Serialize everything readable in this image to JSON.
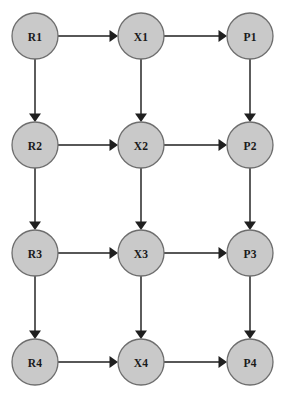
{
  "diagram": {
    "type": "directed-graph",
    "layout": "grid",
    "columns": 3,
    "rows": 4,
    "background_color": "#ffffff",
    "node_fill_color": "#c9c9c9",
    "node_stroke_color": "#6e6e6e",
    "edge_color": "#1f1f1f",
    "label_color": "#1a1a1a",
    "node_radius": 23,
    "nodes": [
      {
        "id": "R1",
        "label": "R1",
        "column": 0,
        "row": 0,
        "cx": 35,
        "cy": 36
      },
      {
        "id": "X1",
        "label": "X1",
        "column": 1,
        "row": 0,
        "cx": 141,
        "cy": 36
      },
      {
        "id": "P1",
        "label": "P1",
        "column": 2,
        "row": 0,
        "cx": 250,
        "cy": 36
      },
      {
        "id": "R2",
        "label": "R2",
        "column": 0,
        "row": 1,
        "cx": 35,
        "cy": 145
      },
      {
        "id": "X2",
        "label": "X2",
        "column": 1,
        "row": 1,
        "cx": 141,
        "cy": 145
      },
      {
        "id": "P2",
        "label": "P2",
        "column": 2,
        "row": 1,
        "cx": 250,
        "cy": 145
      },
      {
        "id": "R3",
        "label": "R3",
        "column": 0,
        "row": 2,
        "cx": 35,
        "cy": 253
      },
      {
        "id": "X3",
        "label": "X3",
        "column": 1,
        "row": 2,
        "cx": 141,
        "cy": 253
      },
      {
        "id": "P3",
        "label": "P3",
        "column": 2,
        "row": 2,
        "cx": 250,
        "cy": 253
      },
      {
        "id": "R4",
        "label": "R4",
        "column": 0,
        "row": 3,
        "cx": 35,
        "cy": 362
      },
      {
        "id": "X4",
        "label": "X4",
        "column": 1,
        "row": 3,
        "cx": 141,
        "cy": 362
      },
      {
        "id": "P4",
        "label": "P4",
        "column": 2,
        "row": 3,
        "cx": 250,
        "cy": 362
      }
    ],
    "edges": [
      {
        "from": "R1",
        "to": "X1",
        "direction": "horizontal"
      },
      {
        "from": "X1",
        "to": "P1",
        "direction": "horizontal"
      },
      {
        "from": "R2",
        "to": "X2",
        "direction": "horizontal"
      },
      {
        "from": "X2",
        "to": "P2",
        "direction": "horizontal"
      },
      {
        "from": "R3",
        "to": "X3",
        "direction": "horizontal"
      },
      {
        "from": "X3",
        "to": "P3",
        "direction": "horizontal"
      },
      {
        "from": "R4",
        "to": "X4",
        "direction": "horizontal"
      },
      {
        "from": "X4",
        "to": "P4",
        "direction": "horizontal"
      },
      {
        "from": "R1",
        "to": "R2",
        "direction": "vertical"
      },
      {
        "from": "R2",
        "to": "R3",
        "direction": "vertical"
      },
      {
        "from": "R3",
        "to": "R4",
        "direction": "vertical"
      },
      {
        "from": "X1",
        "to": "X2",
        "direction": "vertical"
      },
      {
        "from": "X2",
        "to": "X3",
        "direction": "vertical"
      },
      {
        "from": "X3",
        "to": "X4",
        "direction": "vertical"
      },
      {
        "from": "P1",
        "to": "P2",
        "direction": "vertical"
      },
      {
        "from": "P2",
        "to": "P3",
        "direction": "vertical"
      },
      {
        "from": "P3",
        "to": "P4",
        "direction": "vertical"
      }
    ]
  }
}
